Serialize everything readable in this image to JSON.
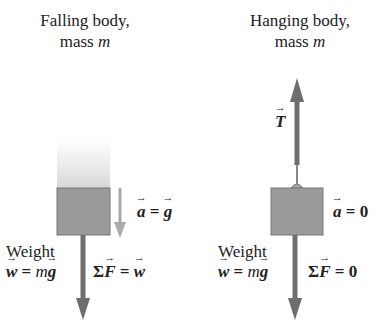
{
  "left": {
    "title_line1": "Falling body,",
    "title_line2_prefix": "mass ",
    "title_line2_var": "m",
    "accel": {
      "lhs": "a",
      "op": " = ",
      "rhs": "g"
    },
    "weight_label": "Weight",
    "weight_eq": {
      "lhs": "w",
      "op": " = ",
      "m": "m",
      "rhs": "g"
    },
    "net_force": {
      "sigma": "Σ",
      "lhs": "F",
      "op": " = ",
      "rhs": "w"
    }
  },
  "right": {
    "title_line1": "Hanging body,",
    "title_line2_prefix": "mass ",
    "title_line2_var": "m",
    "tension": "T",
    "accel": {
      "lhs": "a",
      "op": " = ",
      "rhs": "0"
    },
    "weight_label": "Weight",
    "weight_eq": {
      "lhs": "w",
      "op": " = ",
      "m": "m",
      "rhs": "g"
    },
    "net_force": {
      "sigma": "Σ",
      "lhs": "F",
      "op": " = ",
      "rhs": "0"
    }
  },
  "colors": {
    "block": "#9a9a9a",
    "block_border": "#777777",
    "force_arrow": "#6e6e6e",
    "accel_arrow": "#aaaaaa"
  }
}
